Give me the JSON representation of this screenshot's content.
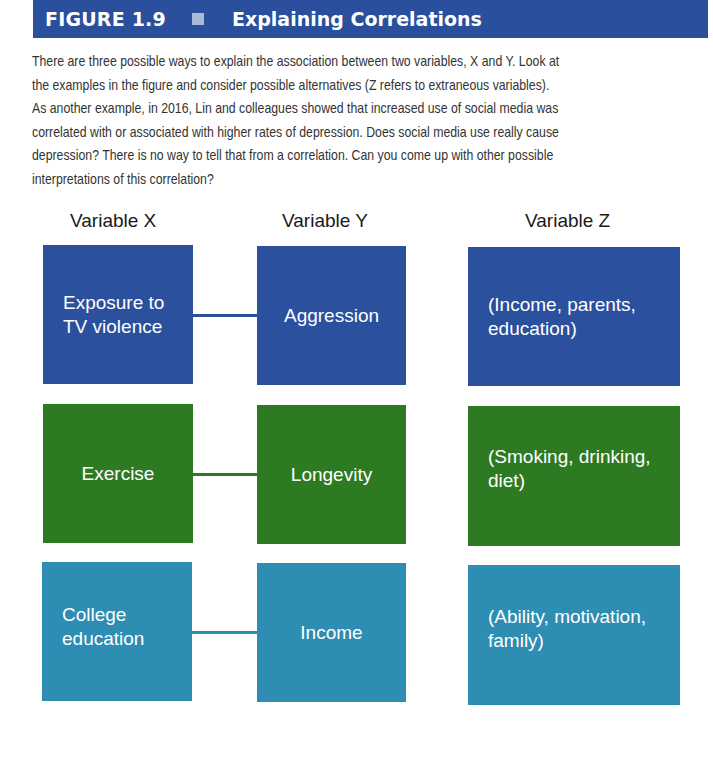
{
  "figure": {
    "number": "FIGURE 1.9",
    "title": "Explaining Correlations",
    "header_color": "#2a4f9c"
  },
  "caption": "There are three possible ways to explain the association between two variables, X and Y. Look at the examples in the figure and consider possible alternatives (Z refers to extraneous variables). As another example, in 2016, Lin and colleagues showed that increased use of social media was correlated with or associated with higher rates of depression. Does social media use really cause depression? There is no way to tell that from a correlation. Can you come up with other possible interpretations of this correlation?",
  "caption_lines": [
    "There are three possible ways to explain the association between two variables, X and Y. Look at",
    "the examples in the figure and consider possible alternatives (Z refers to extraneous variables).",
    "As another example, in 2016, Lin and colleagues showed that increased use of social media was",
    "correlated with or associated with higher rates of depression. Does social media use really cause",
    "depression? There is no way to tell that from a correlation. Can you come up with other possible",
    "interpretations of this correlation?"
  ],
  "columns": {
    "x": "Variable X",
    "y": "Variable Y",
    "z": "Variable Z"
  },
  "rows": [
    {
      "color": "#2b509e",
      "x": "Exposure to TV violence",
      "x_lines": [
        "Exposure to",
        "TV violence"
      ],
      "y": "Aggression",
      "z": "(Income, parents, education)",
      "z_lines": [
        "(Income, parents,",
        "education)"
      ]
    },
    {
      "color": "#2e7a23",
      "x": "Exercise",
      "x_lines": [
        "Exercise"
      ],
      "y": "Longevity",
      "z": "(Smoking, drinking, diet)",
      "z_lines": [
        "(Smoking, drinking,",
        "diet)"
      ]
    },
    {
      "color": "#2e8db2",
      "x": "College education",
      "x_lines": [
        "College",
        "education"
      ],
      "y": "Income",
      "z": "(Ability, motivation, family)",
      "z_lines": [
        "(Ability, motivation,",
        "family)"
      ]
    }
  ]
}
